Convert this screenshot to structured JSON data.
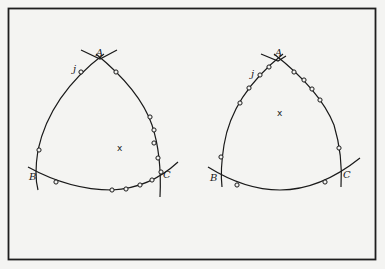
{
  "figure": {
    "panels": [
      {
        "id": "left",
        "labels": {
          "A": "A",
          "B": "B",
          "C": "C",
          "j": "j",
          "center": "x"
        },
        "point_count": 12
      },
      {
        "id": "right",
        "labels": {
          "A": "A",
          "B": "B",
          "C": "C",
          "j": "j",
          "center": "x"
        },
        "point_count": 13
      }
    ],
    "colors": {
      "ink": "#1a1a1a",
      "paper": "#f4f4f2"
    }
  }
}
